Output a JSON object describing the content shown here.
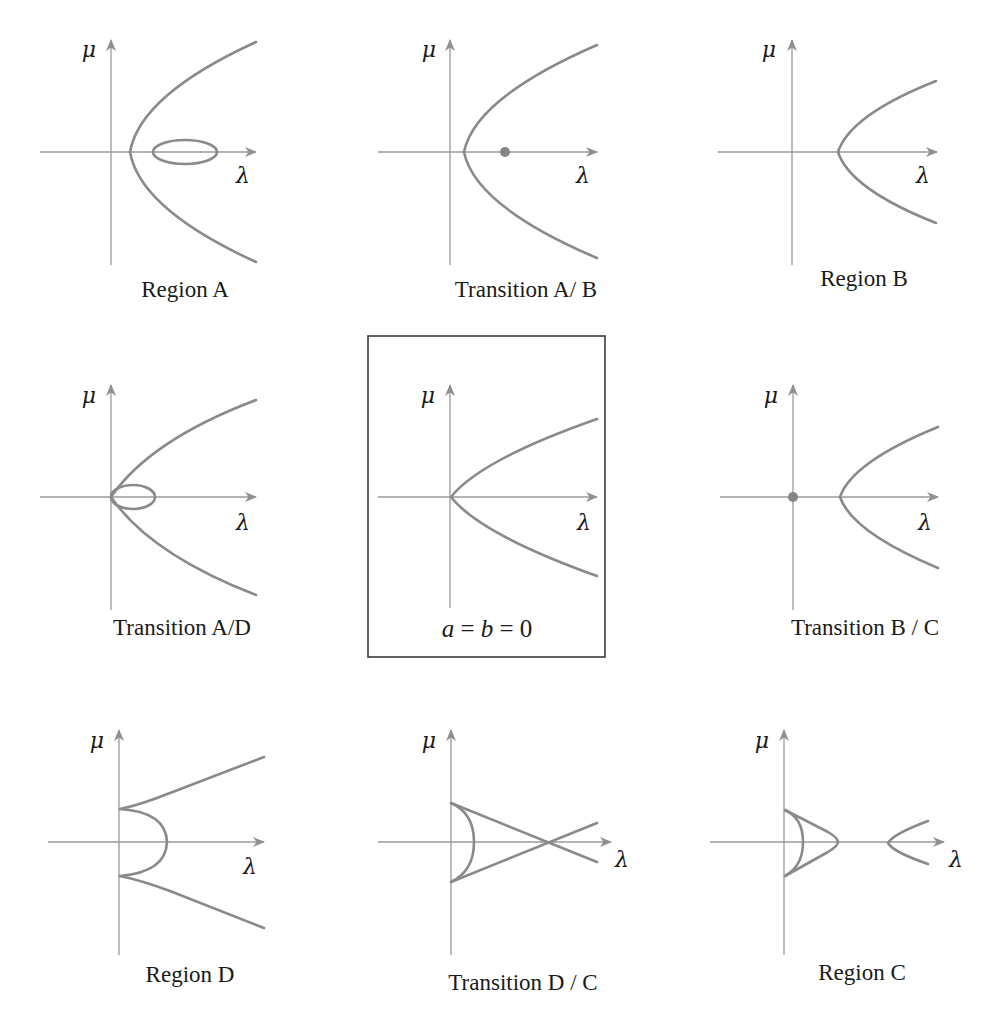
{
  "figure": {
    "axis_labels": {
      "vertical": "μ",
      "horizontal": "λ"
    },
    "colors": {
      "curve": "#8a8a8a",
      "axis": "#9a9a9a",
      "text": "#1a1a1a",
      "frame": "#3a3a3a",
      "dot": "#858585"
    },
    "panels": [
      {
        "id": "region-a",
        "caption": "Region A",
        "caption_pos": [
          185,
          297
        ],
        "axes": {
          "ox": 111,
          "oy": 152,
          "x_start": 40,
          "x_end": 256,
          "y_top": 40,
          "y_bottom": 265
        },
        "mu_label_pos": [
          89,
          57
        ],
        "lambda_label_pos": [
          243,
          183
        ],
        "curves": [
          "M 256 42 Q 140 95 130 152 Q 140 209 256 262"
        ],
        "ellipses": [
          {
            "cx": 185,
            "cy": 152,
            "rx": 32,
            "ry": 12
          }
        ],
        "dots": []
      },
      {
        "id": "transition-a-b",
        "caption": "Transition A/ B",
        "caption_pos": [
          526,
          297
        ],
        "axes": {
          "ox": 450,
          "oy": 152,
          "x_start": 378,
          "x_end": 597,
          "y_top": 40,
          "y_bottom": 265
        },
        "mu_label_pos": [
          429,
          57
        ],
        "lambda_label_pos": [
          583,
          183
        ],
        "curves": [
          "M 597 45 Q 475 98 464 152 Q 475 206 597 258"
        ],
        "ellipses": [],
        "dots": [
          {
            "cx": 505,
            "cy": 152,
            "r": 5
          }
        ]
      },
      {
        "id": "region-b",
        "caption": "Region B",
        "caption_pos": [
          864,
          286
        ],
        "axes": {
          "ox": 792,
          "oy": 152,
          "x_start": 718,
          "x_end": 937,
          "y_top": 40,
          "y_bottom": 265
        },
        "mu_label_pos": [
          769,
          57
        ],
        "lambda_label_pos": [
          923,
          183
        ],
        "curves": [
          "M 936 81 Q 850 115 838 152 Q 850 189 936 223"
        ],
        "ellipses": [],
        "dots": []
      },
      {
        "id": "transition-a-d",
        "caption": "Transition A/D",
        "caption_pos": [
          182,
          635
        ],
        "axes": {
          "ox": 111,
          "oy": 497,
          "x_start": 40,
          "x_end": 256,
          "y_top": 385,
          "y_bottom": 610
        },
        "mu_label_pos": [
          89,
          403
        ],
        "lambda_label_pos": [
          243,
          530
        ],
        "curves": [
          "M 256 400 Q 150 440 111 497 Q 150 554 256 595"
        ],
        "ellipses": [
          {
            "cx": 133,
            "cy": 497,
            "rx": 22,
            "ry": 12
          }
        ],
        "dots": []
      },
      {
        "id": "degenerate-center",
        "caption": "a = b = 0",
        "caption_math": true,
        "caption_pos": [
          487,
          637
        ],
        "framed": true,
        "frame": {
          "x": 368,
          "y": 336,
          "w": 237,
          "h": 321
        },
        "axes": {
          "ox": 450,
          "oy": 497,
          "x_start": 378,
          "x_end": 597,
          "y_top": 385,
          "y_bottom": 608
        },
        "mu_label_pos": [
          428,
          403
        ],
        "lambda_label_pos": [
          584,
          530
        ],
        "curves": [
          "M 597 419 Q 480 460 451 497 Q 480 534 597 576"
        ],
        "ellipses": [],
        "dots": []
      },
      {
        "id": "transition-b-c",
        "caption": "Transition B / C",
        "caption_pos": [
          865,
          635
        ],
        "axes": {
          "ox": 793,
          "oy": 497,
          "x_start": 720,
          "x_end": 938,
          "y_top": 385,
          "y_bottom": 610
        },
        "mu_label_pos": [
          771,
          403
        ],
        "lambda_label_pos": [
          925,
          530
        ],
        "curves": [
          "M 938 427 Q 852 462 840 497 Q 852 532 938 568"
        ],
        "ellipses": [],
        "dots": [
          {
            "cx": 793,
            "cy": 497,
            "r": 5
          }
        ]
      },
      {
        "id": "region-d",
        "caption": "Region D",
        "caption_pos": [
          190,
          982
        ],
        "axes": {
          "ox": 119,
          "oy": 842,
          "x_start": 48,
          "x_end": 264,
          "y_top": 730,
          "y_bottom": 955
        },
        "mu_label_pos": [
          97,
          748
        ],
        "lambda_label_pos": [
          250,
          874
        ],
        "curves": [
          "M 120 809 Q 166 812 167 842 Q 166 872 120 876",
          "M 120 809 Q 140 805 170 793 L 264 757",
          "M 120 876 Q 140 880 170 891 L 264 928"
        ],
        "ellipses": [],
        "dots": []
      },
      {
        "id": "transition-d-c",
        "caption": "Transition D / C",
        "caption_pos": [
          523,
          990
        ],
        "axes": {
          "ox": 451,
          "oy": 842,
          "x_start": 378,
          "x_end": 611,
          "y_top": 730,
          "y_bottom": 955
        },
        "mu_label_pos": [
          429,
          748
        ],
        "lambda_label_pos": [
          622,
          867
        ],
        "curves": [
          "M 451 803 Q 474 813 474 842 Q 474 871 451 882",
          "M 451 803 L 597 862",
          "M 451 882 L 597 823"
        ],
        "ellipses": [],
        "dots": []
      },
      {
        "id": "region-c",
        "caption": "Region C",
        "caption_pos": [
          862,
          980
        ],
        "axes": {
          "ox": 784,
          "oy": 842,
          "x_start": 710,
          "x_end": 944,
          "y_top": 730,
          "y_bottom": 955
        },
        "mu_label_pos": [
          762,
          748
        ],
        "lambda_label_pos": [
          956,
          867
        ],
        "curves": [
          "M 785 810 Q 803 818 803 842 Q 803 866 785 876",
          "M 785 810 L 828 832 Q 838 838 838 842 Q 838 846 828 852 L 785 876",
          "M 928 821 Q 893 834 888 843 Q 893 852 928 864"
        ],
        "ellipses": [],
        "dots": []
      }
    ]
  }
}
